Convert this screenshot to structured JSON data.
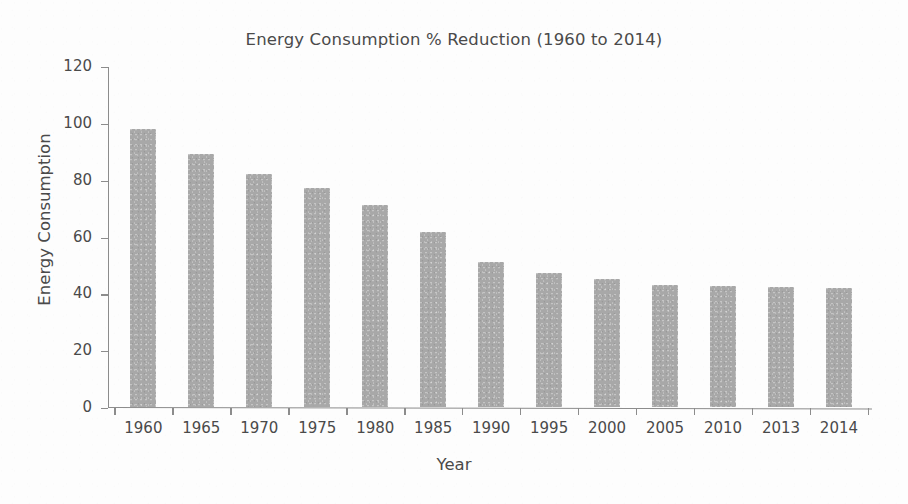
{
  "chart_data": {
    "type": "bar",
    "title": "Energy Consumption % Reduction (1960 to 2014)",
    "xlabel": "Year",
    "ylabel": "Energy Consumption",
    "categories": [
      "1960",
      "1965",
      "1970",
      "1975",
      "1980",
      "1985",
      "1990",
      "1995",
      "2000",
      "2005",
      "2010",
      "2013",
      "2014"
    ],
    "values": [
      98,
      89,
      82,
      77,
      71,
      61.5,
      51,
      47,
      45,
      43,
      42.5,
      42.2,
      42
    ],
    "ylim": [
      0,
      120
    ],
    "yticks": [
      "0",
      "20",
      "40",
      "60",
      "80",
      "100",
      "120"
    ],
    "ytick_values": [
      0,
      20,
      40,
      60,
      80,
      100,
      120
    ],
    "grid": false,
    "legend": false,
    "bar_color": "#a8a8a8",
    "axis_color": "#8c8c8c",
    "text_color": "#4a4a4a"
  }
}
